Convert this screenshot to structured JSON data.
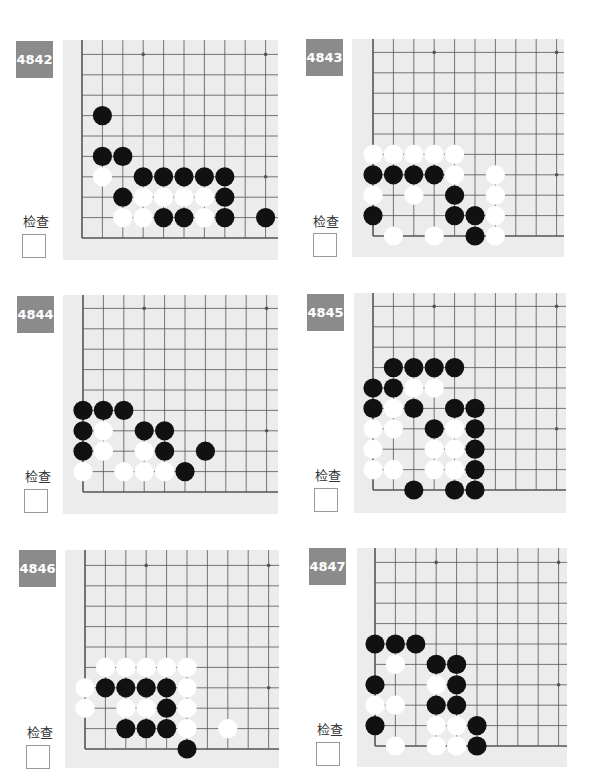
{
  "check_label": "检查",
  "colors": {
    "label_bg": "#8b8b8b",
    "board_bg": "#ececec",
    "grid_line": "#555555",
    "black_stone": "#111111",
    "white_stone": "#ffffff"
  },
  "grid": {
    "cols": 10,
    "rows": 10,
    "spacing": 20.4,
    "star_points": [
      [
        3,
        9
      ],
      [
        9,
        9
      ],
      [
        9,
        3
      ]
    ]
  },
  "problems": [
    {
      "id": "4842",
      "layout": {
        "x": 0,
        "y": 0,
        "label": [
          16,
          41
        ],
        "check_label": [
          21,
          211
        ],
        "checkbox": [
          22,
          234
        ],
        "board": [
          63,
          40,
          215,
          220
        ],
        "origin": [
          19,
          198
        ]
      },
      "black": [
        [
          1,
          6
        ],
        [
          1,
          4
        ],
        [
          2,
          4
        ],
        [
          3,
          3
        ],
        [
          4,
          3
        ],
        [
          5,
          3
        ],
        [
          6,
          3
        ],
        [
          7,
          3
        ],
        [
          2,
          2
        ],
        [
          7,
          2
        ],
        [
          4,
          1
        ],
        [
          5,
          1
        ],
        [
          7,
          1
        ],
        [
          9,
          1
        ]
      ],
      "white": [
        [
          1,
          3
        ],
        [
          3,
          2
        ],
        [
          4,
          2
        ],
        [
          5,
          2
        ],
        [
          6,
          2
        ],
        [
          2,
          1
        ],
        [
          3,
          1
        ],
        [
          6,
          1
        ]
      ]
    },
    {
      "id": "4843",
      "layout": {
        "x": 0,
        "y": 0,
        "label": [
          306,
          39
        ],
        "check_label": [
          311,
          211
        ],
        "checkbox": [
          313,
          233
        ],
        "board": [
          352,
          39,
          212,
          218
        ],
        "origin": [
          21,
          197
        ]
      },
      "black": [
        [
          0,
          3
        ],
        [
          1,
          3
        ],
        [
          2,
          3
        ],
        [
          3,
          3
        ],
        [
          4,
          2
        ],
        [
          0,
          1
        ],
        [
          4,
          1
        ],
        [
          5,
          1
        ],
        [
          5,
          0
        ]
      ],
      "white": [
        [
          0,
          4
        ],
        [
          1,
          4
        ],
        [
          2,
          4
        ],
        [
          3,
          4
        ],
        [
          4,
          4
        ],
        [
          4,
          3
        ],
        [
          6,
          3
        ],
        [
          0,
          2
        ],
        [
          2,
          2
        ],
        [
          6,
          2
        ],
        [
          6,
          1
        ],
        [
          1,
          0
        ],
        [
          3,
          0
        ],
        [
          6,
          0
        ]
      ]
    },
    {
      "id": "4844",
      "layout": {
        "x": 0,
        "y": 0,
        "label": [
          17,
          296
        ],
        "check_label": [
          23,
          466
        ],
        "checkbox": [
          24,
          489
        ],
        "board": [
          63,
          295,
          215,
          219
        ],
        "origin": [
          20,
          197
        ]
      },
      "black": [
        [
          0,
          4
        ],
        [
          1,
          4
        ],
        [
          2,
          4
        ],
        [
          0,
          3
        ],
        [
          3,
          3
        ],
        [
          4,
          3
        ],
        [
          0,
          2
        ],
        [
          4,
          2
        ],
        [
          6,
          2
        ],
        [
          5,
          1
        ]
      ],
      "white": [
        [
          1,
          3
        ],
        [
          1,
          2
        ],
        [
          3,
          2
        ],
        [
          0,
          1
        ],
        [
          2,
          1
        ],
        [
          3,
          1
        ],
        [
          4,
          1
        ]
      ]
    },
    {
      "id": "4845",
      "layout": {
        "x": 0,
        "y": 0,
        "label": [
          307,
          294
        ],
        "check_label": [
          313,
          465
        ],
        "checkbox": [
          314,
          488
        ],
        "board": [
          354,
          293,
          212,
          220
        ],
        "origin": [
          19,
          197
        ]
      },
      "black": [
        [
          1,
          6
        ],
        [
          2,
          6
        ],
        [
          3,
          6
        ],
        [
          4,
          6
        ],
        [
          0,
          5
        ],
        [
          1,
          5
        ],
        [
          0,
          4
        ],
        [
          2,
          4
        ],
        [
          4,
          4
        ],
        [
          5,
          4
        ],
        [
          3,
          3
        ],
        [
          5,
          3
        ],
        [
          5,
          2
        ],
        [
          5,
          1
        ],
        [
          2,
          0
        ],
        [
          4,
          0
        ],
        [
          5,
          0
        ]
      ],
      "white": [
        [
          2,
          5
        ],
        [
          3,
          5
        ],
        [
          1,
          4
        ],
        [
          0,
          3
        ],
        [
          1,
          3
        ],
        [
          4,
          3
        ],
        [
          0,
          2
        ],
        [
          3,
          2
        ],
        [
          4,
          2
        ],
        [
          0,
          1
        ],
        [
          1,
          1
        ],
        [
          3,
          1
        ],
        [
          4,
          1
        ]
      ]
    },
    {
      "id": "4846",
      "layout": {
        "x": 0,
        "y": 0,
        "label": [
          19,
          550
        ],
        "check_label": [
          25,
          722
        ],
        "checkbox": [
          26,
          745
        ],
        "board": [
          65,
          550,
          214,
          218
        ],
        "origin": [
          20,
          199
        ]
      },
      "black": [
        [
          1,
          3
        ],
        [
          2,
          3
        ],
        [
          3,
          3
        ],
        [
          4,
          3
        ],
        [
          4,
          2
        ],
        [
          2,
          1
        ],
        [
          3,
          1
        ],
        [
          4,
          1
        ],
        [
          5,
          0
        ]
      ],
      "white": [
        [
          1,
          4
        ],
        [
          2,
          4
        ],
        [
          3,
          4
        ],
        [
          4,
          4
        ],
        [
          5,
          4
        ],
        [
          0,
          3
        ],
        [
          5,
          3
        ],
        [
          0,
          2
        ],
        [
          2,
          2
        ],
        [
          3,
          2
        ],
        [
          5,
          2
        ],
        [
          5,
          1
        ],
        [
          7,
          1
        ]
      ]
    },
    {
      "id": "4847",
      "layout": {
        "x": 0,
        "y": 0,
        "label": [
          309,
          548
        ],
        "check_label": [
          315,
          719
        ],
        "checkbox": [
          316,
          742
        ],
        "board": [
          357,
          548,
          210,
          219
        ],
        "origin": [
          18,
          198
        ]
      },
      "black": [
        [
          0,
          5
        ],
        [
          1,
          5
        ],
        [
          2,
          5
        ],
        [
          3,
          4
        ],
        [
          4,
          4
        ],
        [
          0,
          3
        ],
        [
          4,
          3
        ],
        [
          3,
          2
        ],
        [
          4,
          2
        ],
        [
          0,
          1
        ],
        [
          5,
          1
        ],
        [
          5,
          0
        ]
      ],
      "white": [
        [
          1,
          4
        ],
        [
          3,
          3
        ],
        [
          0,
          2
        ],
        [
          1,
          2
        ],
        [
          3,
          1
        ],
        [
          4,
          1
        ],
        [
          1,
          0
        ],
        [
          3,
          0
        ],
        [
          4,
          0
        ]
      ]
    }
  ]
}
